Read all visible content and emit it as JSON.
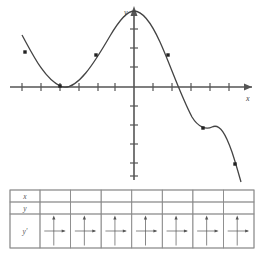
{
  "figure": {
    "type": "math-graph-with-table",
    "graph": {
      "x_axis_label": "x",
      "y_axis_label": "y",
      "axis_color": "#555555",
      "curve_color": "#444444",
      "point_color": "#222222",
      "x_axis_y_px": 87,
      "y_axis_x_px": 134,
      "x_tick_spacing_px": 19.5,
      "y_tick_spacing_px": 19.5,
      "x_ticks_left": 7,
      "x_ticks_right": 6,
      "y_ticks_up": 4,
      "y_ticks_down": 5,
      "curve_path": "M 22,35 C 33,55 44,78 60,86 C 76,94 96,60 110,36 C 120,19 128,11 134,11 C 141,11 150,20 160,42 C 170,64 180,94 192,117 C 198,127 206,130 212,127 C 220,123 226,135 232,152 C 236,164 239,175 241,182",
      "marked_points": [
        {
          "cx": 25,
          "cy": 52
        },
        {
          "cx": 60,
          "cy": 86
        },
        {
          "cx": 96,
          "cy": 55
        },
        {
          "cx": 168,
          "cy": 55
        },
        {
          "cx": 203,
          "cy": 128
        },
        {
          "cx": 235,
          "cy": 164
        }
      ]
    },
    "table": {
      "border_color": "#8c8c8c",
      "row_labels": [
        "x",
        "y",
        "y'"
      ],
      "rows": [
        {
          "label": "x",
          "cells": [
            "",
            "",
            "",
            "",
            "",
            "",
            ""
          ]
        },
        {
          "label": "y",
          "cells": [
            "",
            "",
            "",
            "",
            "",
            "",
            ""
          ]
        },
        {
          "label": "y'",
          "cells": [
            "axes-cross-icon",
            "axes-cross-icon",
            "axes-cross-icon",
            "axes-cross-icon",
            "axes-cross-icon",
            "axes-cross-icon",
            "axes-cross-icon"
          ]
        }
      ],
      "column_count": 7,
      "cell_icon": "axes-cross-icon"
    }
  }
}
